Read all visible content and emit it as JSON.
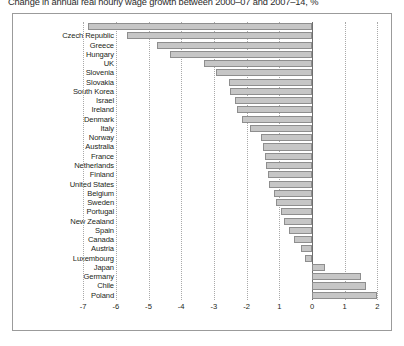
{
  "chart_data": {
    "type": "bar",
    "orientation": "horizontal",
    "title": "Change in annual real hourly wage growth between 2000–07 and 2007–14, %",
    "xlabel": "",
    "ylabel": "",
    "xlim": [
      -7.2,
      2.3
    ],
    "grid": true,
    "legend": false,
    "xticks": [
      "-7",
      "-6",
      "-5",
      "-4",
      "-3",
      "-2",
      "1",
      "0",
      "1",
      "2"
    ],
    "xtick_values": [
      -7,
      -6,
      -5,
      -4,
      -3,
      -2,
      -1,
      0,
      1,
      2
    ],
    "bar_color": "#c6c6c6",
    "bar_edge_color": "#8e8e8e",
    "categories": [
      "Estonia",
      "Czech Republic",
      "Greece",
      "Hungary",
      "UK",
      "Slovenia",
      "Slovakia",
      "South Korea",
      "Israel",
      "Ireland",
      "Denmark",
      "Italy",
      "Norway",
      "Australia",
      "France",
      "Netherlands",
      "Finland",
      "United States",
      "Belgium",
      "Sweden",
      "Portugal",
      "New Zealand",
      "Spain",
      "Canada",
      "Austria",
      "Luxembourg",
      "Japan",
      "Germany",
      "Chile",
      "Poland"
    ],
    "values": [
      -6.85,
      -5.65,
      -4.75,
      -4.35,
      -3.3,
      -2.95,
      -2.55,
      -2.5,
      -2.35,
      -2.3,
      -2.15,
      -1.9,
      -1.55,
      -1.5,
      -1.45,
      -1.4,
      -1.35,
      -1.3,
      -1.15,
      -1.1,
      -0.95,
      -0.85,
      -0.7,
      -0.55,
      -0.35,
      -0.2,
      0.4,
      1.5,
      1.65,
      2.0
    ]
  }
}
